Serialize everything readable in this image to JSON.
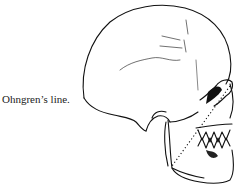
{
  "figure": {
    "caption": "Ohngren’s line.",
    "illustration": "lateral-skull-drawing-with-dotted-ohngren-line"
  }
}
